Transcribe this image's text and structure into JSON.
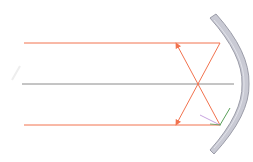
{
  "diagram": {
    "colors": {
      "background": "#ffffff",
      "ray": "#f2734f",
      "axis": "#8a8a8a",
      "mirror_fill": "#c9cad4",
      "mirror_edge": "#9b9ca8",
      "normal": "#b98ad6",
      "tangent": "#5aa05a"
    },
    "elements": [
      {
        "id": "incident-ray-top",
        "kind": "ray",
        "y": 43
      },
      {
        "id": "principal-axis",
        "kind": "axis",
        "y": 84
      },
      {
        "id": "incident-ray-bottom",
        "kind": "ray",
        "y": 125
      },
      {
        "id": "reflected-ray-top",
        "kind": "ray",
        "from": [
          220,
          43
        ],
        "to": [
          177,
          125
        ]
      },
      {
        "id": "reflected-ray-bottom",
        "kind": "ray",
        "from": [
          220,
          125
        ],
        "to": [
          177,
          43
        ]
      },
      {
        "id": "focal-point",
        "kind": "point",
        "at": [
          198,
          84
        ]
      },
      {
        "id": "concave-mirror",
        "kind": "mirror"
      }
    ]
  }
}
